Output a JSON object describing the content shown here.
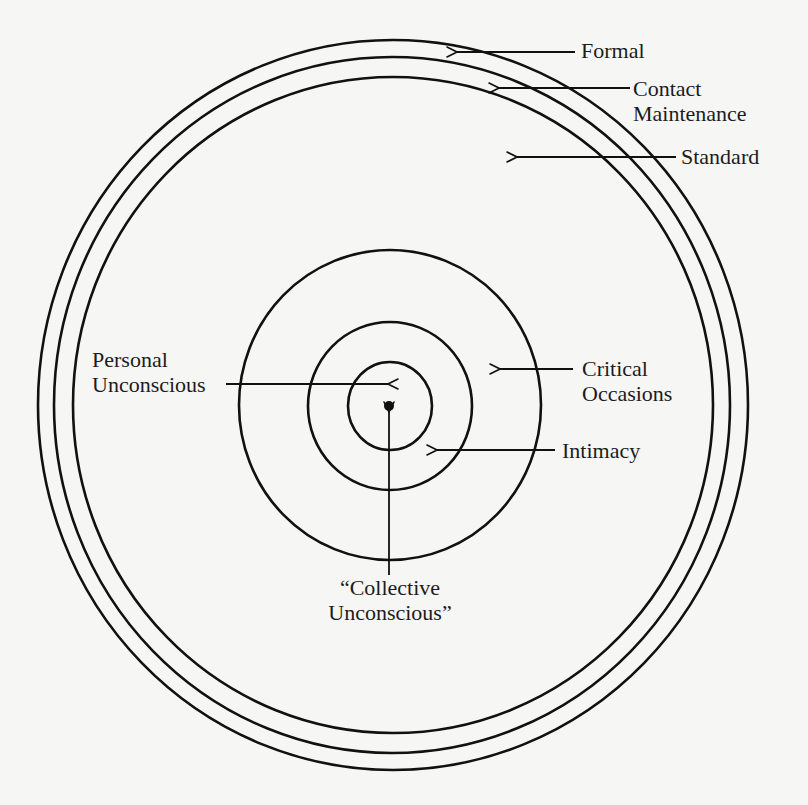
{
  "diagram": {
    "type": "concentric-rings",
    "colors": {
      "background": "#f6f6f4",
      "stroke": "#111111",
      "text": "#1c1c1c"
    },
    "rings_outer": [
      {
        "name": "formal",
        "cx": 393,
        "cy": 405,
        "rx": 355,
        "ry": 365
      },
      {
        "name": "contact-maintenance",
        "cx": 392,
        "cy": 405,
        "rx": 338,
        "ry": 348
      },
      {
        "name": "standard",
        "cx": 393,
        "cy": 405,
        "rx": 320,
        "ry": 328
      }
    ],
    "rings_inner": [
      {
        "name": "critical-occasions",
        "cx": 390,
        "cy": 405,
        "rx": 151,
        "ry": 155
      },
      {
        "name": "intimacy",
        "cx": 390,
        "cy": 406,
        "rx": 82,
        "ry": 84
      },
      {
        "name": "personal-unconscious",
        "cx": 390,
        "cy": 406,
        "rx": 42,
        "ry": 44
      }
    ],
    "center_dot": {
      "cx": 389,
      "cy": 406,
      "r": 4.5
    },
    "labels": {
      "formal": "Formal",
      "contact_line1": "Contact",
      "contact_line2": "Maintenance",
      "standard": "Standard",
      "personal_line1": "Personal",
      "personal_line2": "Unconscious",
      "critical_line1": "Critical",
      "critical_line2": "Occasions",
      "intimacy": "Intimacy",
      "collective_line1": "“Collective",
      "collective_line2": "Unconscious”"
    }
  }
}
